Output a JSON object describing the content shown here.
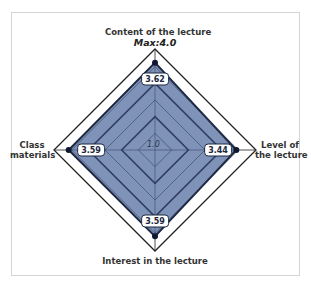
{
  "chart_data": {
    "type": "radar",
    "title": "",
    "axes": [
      "Content of the lecture",
      "Level of the lecture",
      "Interest in the lecture",
      "Class materials"
    ],
    "series": [
      {
        "name": "Score",
        "values": [
          3.62,
          3.44,
          3.59,
          3.59
        ]
      }
    ],
    "range": [
      1.0,
      4.0
    ],
    "min_label": "1.0",
    "max_label": "Max:4.0",
    "gridlines": [
      1.5,
      2.0,
      2.5,
      3.0,
      3.5,
      4.0
    ],
    "major_gridlines": [
      2.0,
      3.0
    ],
    "legend": "none",
    "data_labels": [
      "3.62",
      "3.44",
      "3.59",
      "3.59"
    ],
    "colors": {
      "fill": "#7f92b7",
      "stroke": "#1c2740",
      "grid": "#2b3a5e",
      "outer": "#222222"
    }
  },
  "labels": {
    "top": "Content of the lecture",
    "max": "Max:4.0",
    "right_line1": "Level of",
    "right_line2": "the lecture",
    "bottom": "Interest in the lecture",
    "left_line1": "Class",
    "left_line2": "materials",
    "center": "1.0"
  },
  "values": {
    "top": "3.62",
    "right": "3.44",
    "bottom": "3.59",
    "left": "3.59"
  }
}
